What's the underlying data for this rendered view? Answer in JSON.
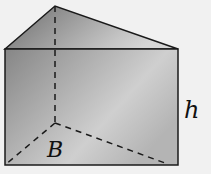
{
  "diagram": {
    "type": "triangular-prism",
    "labels": {
      "base": "B",
      "height": "h"
    },
    "colors": {
      "background": "#f1f1f1",
      "edge": "#1a1a1a",
      "front_face_dark": "#8a8a8a",
      "front_face_light": "#d8d8d8",
      "top_face_dark": "#707070",
      "top_face_light": "#c8c8c8"
    }
  }
}
